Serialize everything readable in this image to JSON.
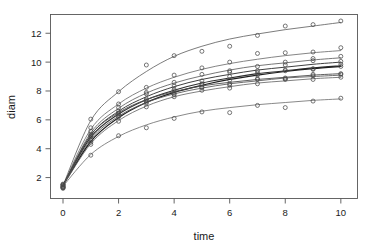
{
  "chart_data": {
    "type": "line",
    "title": "",
    "subtitle": "",
    "xlabel": "time",
    "ylabel": "diam",
    "xlim": [
      -0.45,
      10.6
    ],
    "ylim": [
      0.55,
      13.3
    ],
    "xticks": [
      0,
      2,
      4,
      6,
      8,
      10
    ],
    "xtick_labels": [
      "0",
      "2",
      "4",
      "6",
      "8",
      "10"
    ],
    "yticks": [
      2,
      4,
      6,
      8,
      10,
      12
    ],
    "ytick_labels": [
      "2",
      "4",
      "6",
      "8",
      "10",
      "12"
    ],
    "grid": false,
    "legend": "none",
    "marker": "open-circle",
    "x": [
      0,
      1,
      2,
      3,
      4,
      5,
      6,
      7,
      8,
      9,
      10
    ],
    "series": [
      {
        "name": "subject-1",
        "color": "#5a5a5a",
        "linewidth": 0.8,
        "values": [
          1.45,
          5.95,
          7.95,
          9.35,
          10.4,
          11.1,
          11.6,
          11.95,
          12.25,
          12.5,
          12.75
        ],
        "points": [
          1.35,
          6.05,
          7.95,
          9.8,
          10.45,
          10.75,
          11.1,
          11.85,
          12.5,
          12.6,
          12.85
        ]
      },
      {
        "name": "subject-2",
        "color": "#666666",
        "linewidth": 0.8,
        "values": [
          1.45,
          5.35,
          7.1,
          8.2,
          8.95,
          9.5,
          9.9,
          10.2,
          10.45,
          10.65,
          10.8
        ],
        "points": [
          1.5,
          5.45,
          7.1,
          8.25,
          9.1,
          9.6,
          10.0,
          10.6,
          10.65,
          10.7,
          11.0
        ]
      },
      {
        "name": "subject-3",
        "color": "#5f5f5f",
        "linewidth": 0.85,
        "values": [
          1.42,
          5.1,
          6.8,
          7.85,
          8.55,
          9.05,
          9.45,
          9.75,
          9.95,
          10.15,
          10.3
        ],
        "points": [
          1.3,
          5.2,
          6.85,
          7.9,
          8.6,
          9.15,
          9.4,
          9.7,
          10.0,
          10.25,
          10.4
        ]
      },
      {
        "name": "subject-4",
        "color": "#404040",
        "linewidth": 1.0,
        "values": [
          1.45,
          4.95,
          6.6,
          7.6,
          8.3,
          8.8,
          9.15,
          9.45,
          9.65,
          9.85,
          10.0
        ],
        "points": [
          1.4,
          4.9,
          6.6,
          7.8,
          8.35,
          8.7,
          9.3,
          9.4,
          9.8,
          10.1,
          10.05
        ]
      },
      {
        "name": "subject-5",
        "color": "#2e2e2e",
        "linewidth": 1.1,
        "values": [
          1.45,
          4.8,
          6.4,
          7.4,
          8.05,
          8.55,
          8.9,
          9.2,
          9.4,
          9.6,
          9.75
        ],
        "points": [
          1.55,
          4.85,
          6.45,
          7.35,
          8.1,
          8.5,
          9.0,
          9.25,
          9.45,
          9.55,
          9.85
        ]
      },
      {
        "name": "subject-6",
        "color": "#1f1f1f",
        "linewidth": 1.2,
        "values": [
          1.45,
          4.5,
          6.15,
          7.2,
          7.9,
          8.4,
          8.8,
          9.1,
          9.35,
          9.55,
          9.7
        ],
        "points": [
          1.45,
          4.45,
          6.2,
          7.25,
          7.85,
          8.45,
          8.75,
          9.1,
          9.4,
          9.5,
          9.7
        ]
      },
      {
        "name": "subject-7",
        "color": "#4d4d4d",
        "linewidth": 0.9,
        "values": [
          1.45,
          4.95,
          6.5,
          7.4,
          7.95,
          8.35,
          8.6,
          8.8,
          8.95,
          9.1,
          9.2
        ],
        "points": [
          1.3,
          5.0,
          6.45,
          7.45,
          8.0,
          8.25,
          8.5,
          8.85,
          8.9,
          9.15,
          9.15
        ]
      },
      {
        "name": "subject-8",
        "color": "#555555",
        "linewidth": 0.85,
        "values": [
          1.45,
          4.65,
          6.25,
          7.2,
          7.8,
          8.2,
          8.5,
          8.7,
          8.9,
          9.0,
          9.1
        ],
        "points": [
          1.5,
          4.6,
          6.3,
          7.15,
          7.75,
          8.25,
          8.4,
          8.8,
          8.85,
          9.05,
          9.2
        ]
      },
      {
        "name": "subject-9",
        "color": "#606060",
        "linewidth": 0.8,
        "values": [
          1.43,
          4.35,
          5.95,
          6.95,
          7.6,
          8.0,
          8.3,
          8.55,
          8.7,
          8.85,
          8.95
        ],
        "points": [
          1.35,
          4.3,
          5.9,
          6.9,
          7.6,
          8.05,
          8.2,
          8.5,
          8.8,
          8.8,
          8.95
        ]
      },
      {
        "name": "subject-10",
        "color": "#6b6b6b",
        "linewidth": 0.8,
        "values": [
          1.4,
          3.6,
          4.85,
          5.65,
          6.2,
          6.6,
          6.85,
          7.05,
          7.2,
          7.35,
          7.45
        ],
        "points": [
          1.25,
          3.55,
          4.9,
          5.45,
          6.1,
          6.55,
          6.5,
          7.0,
          6.85,
          7.3,
          7.5
        ]
      }
    ]
  }
}
